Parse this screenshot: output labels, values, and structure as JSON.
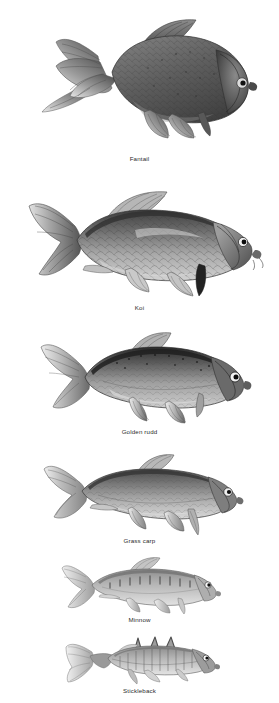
{
  "plate": {
    "background_color": "#ffffff",
    "caption_color": "#2b2b2b",
    "ink_dark": "#1a1a1a",
    "ink_mid": "#6e6e6e",
    "ink_light": "#c9c9c9",
    "style": "grayscale pencil illustration",
    "entry_count": 6
  },
  "fish": [
    {
      "index": 1,
      "label": "Fantail",
      "body_shape": "deep-bodied, rounded goldfish",
      "tail": "long trailing double fantail",
      "tone": "dark mottled grey",
      "caption_center_x": 168,
      "caption_y": 156
    },
    {
      "index": 2,
      "label": "Koi",
      "body_shape": "stocky carp with large scales",
      "tail": "broad forked caudal fin",
      "tone": "patchwork light and dark grey",
      "caption_center_x": 172,
      "caption_y": 307
    },
    {
      "index": 3,
      "label": "Golden rudd",
      "body_shape": "oval compressed body",
      "tail": "pale forked tail",
      "tone": "dark speckled back, pale flanks",
      "caption_center_x": 168,
      "caption_y": 432
    },
    {
      "index": 4,
      "label": "Grass carp",
      "body_shape": "elongated torpedo body",
      "tail": "forked tail",
      "tone": "mid grey with scale lines",
      "caption_center_x": 168,
      "caption_y": 538
    },
    {
      "index": 5,
      "label": "Minnow",
      "body_shape": "small slender body",
      "tail": "small forked tail",
      "tone": "pale grey with dark lateral bars",
      "caption_center_x": 168,
      "caption_y": 617
    },
    {
      "index": 6,
      "label": "Stickleback",
      "body_shape": "slim body with dorsal spines",
      "tail": "small fan tail",
      "tone": "light grey with vertical striping",
      "caption_center_x": 168,
      "caption_y": 688
    }
  ]
}
